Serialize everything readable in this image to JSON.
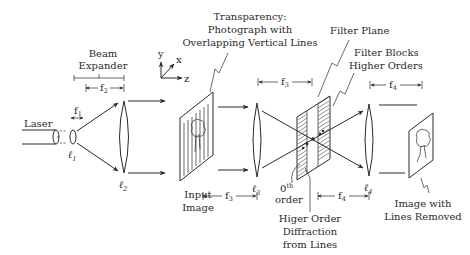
{
  "diagram": {
    "labels": {
      "laser": "Laser",
      "beam_expander_line1": "Beam",
      "beam_expander_line2": "Expander",
      "transparency_line1": "Transparency:",
      "transparency_line2": "Photograph with",
      "transparency_line3": "Overlapping Vertical Lines",
      "filter_plane": "Filter Plane",
      "filter_blocks_line1": "Filter Blocks",
      "filter_blocks_line2": "Higher Orders",
      "input_image_line1": "Input",
      "input_image_line2": "Image",
      "zeroth_order_main": "0",
      "zeroth_order_sup": "th",
      "zeroth_order_line2": "order",
      "higher_order_line1": "Higer Order",
      "higher_order_line2": "Diffraction",
      "higher_order_line3": "from Lines",
      "output_line1": "Image with",
      "output_line2": "Lines Removed"
    },
    "lenses": [
      {
        "id": "l1",
        "symbol": "ℓ",
        "sub": "1"
      },
      {
        "id": "l2",
        "symbol": "ℓ",
        "sub": "2"
      },
      {
        "id": "l3",
        "symbol": "ℓ",
        "sub": "3"
      },
      {
        "id": "l4",
        "symbol": "ℓ",
        "sub": "4"
      }
    ],
    "focal_lengths": [
      {
        "id": "f1",
        "symbol": "f",
        "sub": "1"
      },
      {
        "id": "f2",
        "symbol": "f",
        "sub": "2"
      },
      {
        "id": "f3_top",
        "symbol": "f",
        "sub": "3"
      },
      {
        "id": "f3_bottom",
        "symbol": "f",
        "sub": "3"
      },
      {
        "id": "f4_top",
        "symbol": "f",
        "sub": "4"
      },
      {
        "id": "f4_bottom",
        "symbol": "f",
        "sub": "4"
      }
    ],
    "axes": {
      "x": "x",
      "y": "y",
      "z": "z"
    }
  }
}
